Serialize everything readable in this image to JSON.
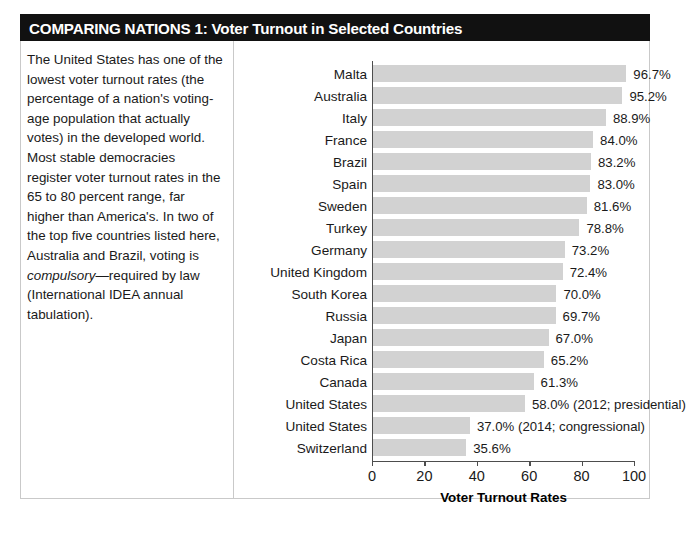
{
  "header": {
    "title": "COMPARING NATIONS 1: Voter Turnout in Selected Countries"
  },
  "sidebar": {
    "paragraph_part1": "The United States has one of the lowest voter turnout rates (the percentage of a nation's voting-age population that actually votes) in the developed world. Most stable democracies register voter turnout rates in the 65 to 80 percent range, far higher than America's. In two of the top five countries listed here, Australia and Brazil, voting is ",
    "paragraph_italic": "compulsory",
    "paragraph_part2": "—required by law (International IDEA annual tabulation)."
  },
  "chart_data": {
    "type": "bar",
    "orientation": "horizontal",
    "title": "",
    "xlabel": "Voter Turnout Rates",
    "ylabel": "",
    "xlim": [
      0,
      105
    ],
    "xticks": [
      0,
      20,
      40,
      60,
      80,
      100
    ],
    "xtick_labels": [
      "0",
      "20",
      "40",
      "60",
      "80",
      "100"
    ],
    "grid": false,
    "legend": false,
    "bar_color": "#d2d2d2",
    "categories": [
      "Malta",
      "Australia",
      "Italy",
      "France",
      "Brazil",
      "Spain",
      "Sweden",
      "Turkey",
      "Germany",
      "United Kingdom",
      "South Korea",
      "Russia",
      "Japan",
      "Costa Rica",
      "Canada",
      "United States",
      "United States",
      "Switzerland"
    ],
    "values": [
      96.7,
      95.2,
      88.9,
      84.0,
      83.2,
      83.0,
      81.6,
      78.8,
      73.2,
      72.4,
      70.0,
      69.7,
      67.0,
      65.2,
      61.3,
      58.0,
      37.0,
      35.6
    ],
    "data_labels": [
      "96.7%",
      "95.2%",
      "88.9%",
      "84.0%",
      "83.2%",
      "83.0%",
      "81.6%",
      "78.8%",
      "73.2%",
      "72.4%",
      "70.0%",
      "69.7%",
      "67.0%",
      "65.2%",
      "61.3%",
      "58.0% (2012; presidential)",
      "37.0% (2014; congressional)",
      "35.6%"
    ]
  }
}
